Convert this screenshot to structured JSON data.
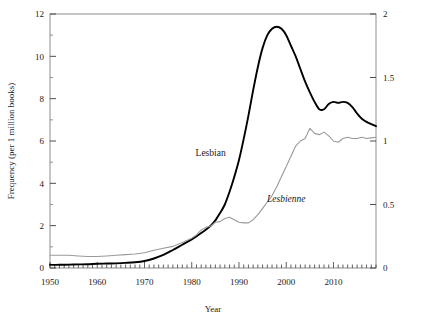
{
  "chart_data": {
    "type": "line",
    "title": "",
    "xlabel": "Year",
    "ylabel": "Frequency (per 1 million books)",
    "ylabel_right": "",
    "xlim": [
      1950,
      2019
    ],
    "ylim": [
      0,
      12
    ],
    "ylim_right": [
      0,
      2
    ],
    "xticks": [
      1950,
      1960,
      1970,
      1980,
      1990,
      2000,
      2010
    ],
    "xticklabels": [
      "1950",
      "1960",
      "1970",
      "1980",
      "1990",
      "2000",
      "2010"
    ],
    "yticks": [
      0,
      2,
      4,
      6,
      8,
      10,
      12
    ],
    "yticklabels": [
      "0",
      "2",
      "4",
      "6",
      "8",
      "10",
      "12"
    ],
    "yticks_right": [
      0,
      0.5,
      1,
      1.5,
      2
    ],
    "yticklabels_right": [
      "0",
      "0.5",
      "1",
      "1.5",
      "2"
    ],
    "minor_xticks_interval": 1,
    "grid": false,
    "legend_position": "inline-annotations",
    "series": [
      {
        "name": "Lesbian",
        "axis": "left",
        "color": "#000000",
        "width": 1.9,
        "style": "roman",
        "annotation": "Lesbian",
        "annotation_year": 1984.0,
        "annotation_value": 5.3,
        "x": [
          1950,
          1952,
          1954,
          1956,
          1958,
          1960,
          1962,
          1964,
          1966,
          1968,
          1970,
          1972,
          1974,
          1976,
          1978,
          1980,
          1982,
          1984,
          1985,
          1986,
          1987,
          1988,
          1989,
          1990,
          1991,
          1992,
          1993,
          1994,
          1995,
          1996,
          1997,
          1998,
          1999,
          2000,
          2001,
          2002,
          2003,
          2004,
          2005,
          2006,
          2007,
          2008,
          2009,
          2010,
          2011,
          2012,
          2013,
          2014,
          2015,
          2016,
          2017,
          2018,
          2019
        ],
        "y": [
          0.15,
          0.15,
          0.16,
          0.17,
          0.18,
          0.2,
          0.21,
          0.22,
          0.24,
          0.27,
          0.33,
          0.45,
          0.62,
          0.85,
          1.1,
          1.35,
          1.65,
          2.0,
          2.25,
          2.6,
          3.0,
          3.6,
          4.3,
          5.1,
          6.1,
          7.2,
          8.4,
          9.5,
          10.4,
          11.0,
          11.3,
          11.4,
          11.3,
          11.0,
          10.5,
          10.0,
          9.4,
          8.8,
          8.3,
          7.85,
          7.5,
          7.5,
          7.75,
          7.85,
          7.8,
          7.85,
          7.8,
          7.6,
          7.3,
          7.05,
          6.9,
          6.8,
          6.7
        ]
      },
      {
        "name": "Lesbienne",
        "axis": "right",
        "color": "#9a9a9a",
        "width": 1.1,
        "style": "italic",
        "annotation": "Lesbienne",
        "annotation_year": 2000.0,
        "annotation_value": 0.52,
        "x": [
          1950,
          1952,
          1954,
          1956,
          1958,
          1960,
          1962,
          1964,
          1966,
          1968,
          1970,
          1972,
          1974,
          1976,
          1978,
          1980,
          1981,
          1982,
          1983,
          1984,
          1985,
          1986,
          1987,
          1988,
          1989,
          1990,
          1991,
          1992,
          1993,
          1994,
          1995,
          1996,
          1997,
          1998,
          1999,
          2000,
          2001,
          2002,
          2003,
          2004,
          2005,
          2006,
          2007,
          2008,
          2009,
          2010,
          2011,
          2012,
          2013,
          2014,
          2015,
          2016,
          2017,
          2018,
          2019
        ],
        "y": [
          0.1,
          0.1,
          0.1,
          0.095,
          0.09,
          0.09,
          0.095,
          0.1,
          0.105,
          0.11,
          0.12,
          0.14,
          0.155,
          0.17,
          0.2,
          0.235,
          0.26,
          0.3,
          0.32,
          0.33,
          0.36,
          0.365,
          0.39,
          0.4,
          0.38,
          0.36,
          0.355,
          0.355,
          0.38,
          0.42,
          0.47,
          0.52,
          0.57,
          0.64,
          0.72,
          0.8,
          0.88,
          0.96,
          1.0,
          1.02,
          1.1,
          1.06,
          1.05,
          1.07,
          1.04,
          1.0,
          0.99,
          1.02,
          1.03,
          1.02,
          1.02,
          1.03,
          1.02,
          1.025,
          1.03
        ]
      }
    ]
  },
  "axes": {
    "left_title": "Frequency (per 1 million books)",
    "bottom_title": "Year"
  }
}
